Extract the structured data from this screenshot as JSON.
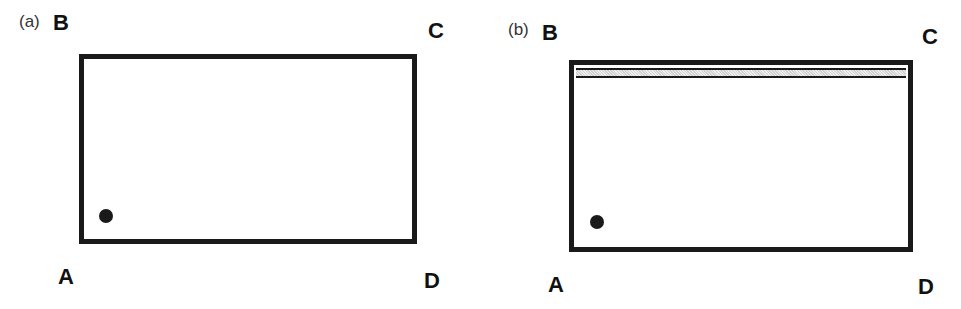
{
  "panels": [
    {
      "label": "(a)",
      "corners": {
        "A": "A",
        "B": "B",
        "C": "C",
        "D": "D"
      },
      "has_band": false
    },
    {
      "label": "(b)",
      "corners": {
        "A": "A",
        "B": "B",
        "C": "C",
        "D": "D"
      },
      "has_band": true
    }
  ]
}
